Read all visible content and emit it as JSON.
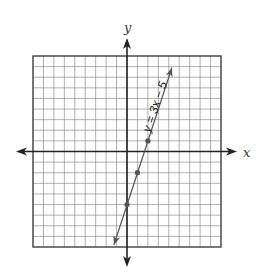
{
  "chart_data": {
    "type": "line",
    "title": "",
    "xlabel": "x",
    "ylabel": "y",
    "xlim": [
      -9,
      9
    ],
    "ylim": [
      -9,
      9
    ],
    "grid": true,
    "grid_step": 1,
    "tick_labels": false,
    "series": [
      {
        "name": "y = 3x − 5",
        "equation": "y = 3x - 5",
        "slope": 3,
        "intercept": -5,
        "plotted_points": [
          {
            "x": 0,
            "y": -5
          },
          {
            "x": 1,
            "y": -2
          },
          {
            "x": 2,
            "y": 1
          }
        ],
        "arrow_ends": [
          {
            "x": -1.25,
            "y": -8.8
          },
          {
            "x": 4.3,
            "y": 7.9
          }
        ],
        "color": "#555555"
      }
    ],
    "annotations": [
      {
        "text": "y = 3x − 5",
        "position": "along line, upper portion",
        "rotation_deg": -71
      }
    ]
  },
  "labels": {
    "x_axis": "x",
    "y_axis": "y",
    "equation": "y = 3x − 5"
  },
  "colors": {
    "grid": "#9a9a9a",
    "grid_border": "#444444",
    "axis": "#222222",
    "line": "#555555",
    "point": "#555555"
  }
}
